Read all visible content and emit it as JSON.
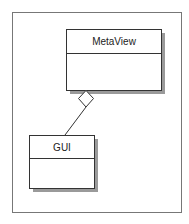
{
  "diagram": {
    "type": "UML class diagram",
    "classes": [
      {
        "id": "metaview",
        "name": "MetaView"
      },
      {
        "id": "gui",
        "name": "GUI"
      }
    ],
    "relationships": [
      {
        "type": "aggregation",
        "whole": "MetaView",
        "part": "GUI",
        "marker": "hollow-diamond"
      }
    ]
  },
  "colors": {
    "line": "#333333",
    "frame": "#777777",
    "shadow": "#9a9a9a",
    "fill": "#ffffff"
  }
}
